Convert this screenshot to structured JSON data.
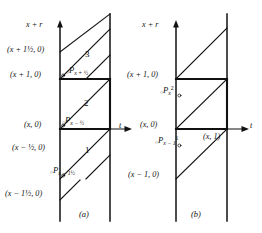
{
  "figure": {
    "caption_a": "(a)",
    "caption_b": "(b)",
    "panels": [
      {
        "id": "a",
        "vertical_axis_label": "x + r",
        "horizontal_axis_label": "t",
        "ordinate_labels": [
          "(x + 1½, 0)",
          "(x + 1, 0)",
          "(x, 0)",
          "(x − ½, 0)",
          "(x − 1½, 0)"
        ],
        "point_labels": [
          {
            "base": "P",
            "sub": "x + ½",
            "sup": ""
          },
          {
            "base": "P",
            "sub": "x − ½",
            "sup": ""
          },
          {
            "base": "P",
            "sub": "x − 1½",
            "sup": ""
          }
        ],
        "region_labels": [
          "3",
          "2",
          "1"
        ]
      },
      {
        "id": "b",
        "vertical_axis_label": "x + r",
        "horizontal_axis_label": "t",
        "ordinate_labels": [
          "(x + 1, 0)",
          "(x, 0)",
          "(x − 1, 0)"
        ],
        "abscissa_label": "(x, 1)",
        "point_labels": [
          {
            "base": "P",
            "sub": "x",
            "sup": "2"
          },
          {
            "base": "P",
            "sub": "x − 1",
            "sup": "1"
          }
        ],
        "region_labels": []
      }
    ],
    "colors": {
      "ink": "#111111",
      "background": "#ffffff"
    }
  }
}
